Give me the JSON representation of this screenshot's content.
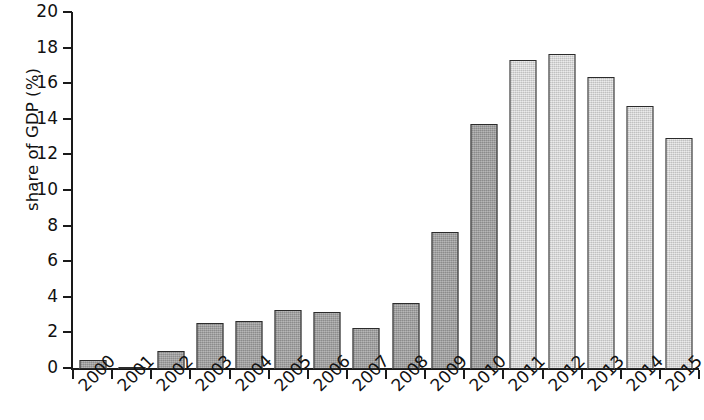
{
  "chart_data": {
    "type": "bar",
    "title": "",
    "subtitle": "",
    "xlabel": "",
    "ylabel": "share of GDP (%)",
    "ylim": [
      0,
      20
    ],
    "yticks": [
      0,
      2,
      4,
      6,
      8,
      10,
      12,
      14,
      16,
      18,
      20
    ],
    "ytick_labels": [
      "0",
      "2",
      "4",
      "6",
      "8",
      "10",
      "12",
      "14",
      "16",
      "18",
      "20"
    ],
    "grid": false,
    "legend": null,
    "legend_position": "none",
    "xtick_rotation": -45,
    "categories": [
      "2000",
      "2001",
      "2002",
      "2003",
      "2004",
      "2005",
      "2006",
      "2007",
      "2008",
      "2009",
      "2010",
      "2011",
      "2012",
      "2013",
      "2014",
      "2015"
    ],
    "values": [
      0.5,
      0.1,
      1.0,
      2.6,
      2.7,
      3.3,
      3.2,
      2.3,
      3.7,
      7.7,
      13.75,
      17.35,
      17.7,
      16.4,
      14.8,
      13.0
    ],
    "bar_styles": [
      "dark",
      "dark",
      "dark",
      "dark",
      "dark",
      "dark",
      "dark",
      "dark",
      "dark",
      "dark",
      "dark",
      "light",
      "light",
      "light",
      "light",
      "light"
    ],
    "colors": {
      "bar_dark": "#9c9c9c",
      "bar_light": "#d2d2d2",
      "bar_edge": "#2b2b2b",
      "axis": "#1a1a1a",
      "text": "#111111",
      "background": "#ffffff"
    }
  }
}
